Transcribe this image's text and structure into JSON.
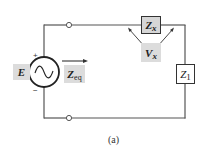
{
  "figure": {
    "caption": "(a)",
    "source": {
      "label": "E",
      "plus": "+",
      "minus": "−",
      "symbol": "ac-sine"
    },
    "zeq": {
      "main": "Z",
      "sub": "eq"
    },
    "zx": {
      "main": "Z",
      "sub": "x"
    },
    "vx": {
      "main": "V",
      "sub": "x"
    },
    "z1": {
      "main": "Z",
      "sub": "1"
    },
    "colors": {
      "wire": "#555555",
      "shade": "#dcdcdc",
      "box_border": "#333333"
    }
  }
}
